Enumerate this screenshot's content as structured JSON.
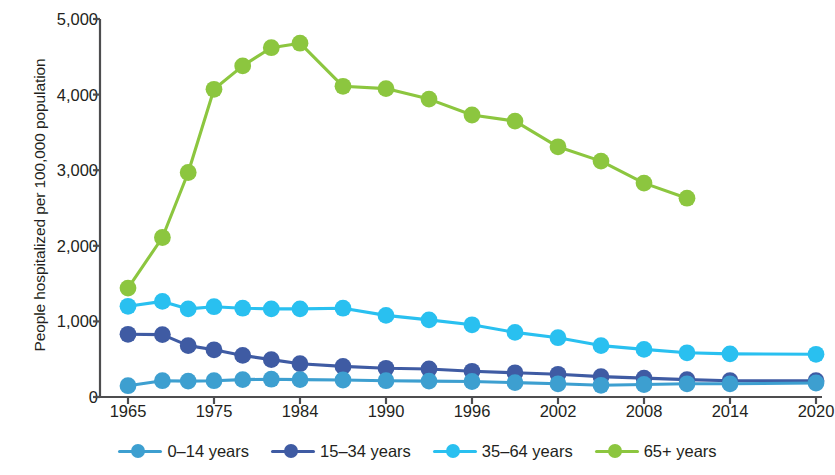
{
  "chart_data": {
    "type": "line",
    "title": "",
    "xlabel": "",
    "ylabel": "People hospitalized per 100,000 population",
    "ylim": [
      0,
      5000
    ],
    "ytick_values": [
      0,
      1000,
      2000,
      3000,
      4000,
      5000
    ],
    "ytick_labels": [
      "0",
      "1,000",
      "2,000",
      "3,000",
      "4,000",
      "5,000"
    ],
    "xtick_labels": [
      "1965",
      "1975",
      "1984",
      "1990",
      "1996",
      "2002",
      "2008",
      "2014",
      "2020"
    ],
    "xtick_values": [
      1965,
      1975,
      1984,
      1990,
      1996,
      2002,
      2008,
      2014,
      2020
    ],
    "x": [
      1965,
      1969,
      1972,
      1975,
      1978,
      1981,
      1984,
      1987,
      1990,
      1993,
      1996,
      1999,
      2002,
      2005,
      2008,
      2011,
      2014,
      2020
    ],
    "grid": false,
    "legend_position": "bottom",
    "series": [
      {
        "name": "0–14 years",
        "color": "#3d9fd0",
        "values": [
          150,
          215,
          210,
          215,
          230,
          235,
          230,
          225,
          215,
          210,
          205,
          190,
          175,
          155,
          165,
          175,
          175,
          185
        ]
      },
      {
        "name": "15–34 years",
        "color": "#3f5ba3",
        "values": [
          830,
          825,
          680,
          625,
          550,
          495,
          440,
          405,
          380,
          370,
          340,
          320,
          300,
          270,
          250,
          230,
          215,
          215
        ]
      },
      {
        "name": "35–64 years",
        "color": "#29c0f0",
        "values": [
          1200,
          1265,
          1165,
          1195,
          1175,
          1165,
          1165,
          1175,
          1080,
          1020,
          955,
          855,
          785,
          680,
          630,
          585,
          570,
          565
        ]
      },
      {
        "name": "65+ years",
        "color": "#8cc63f",
        "values": [
          1440,
          2110,
          2970,
          4070,
          4380,
          4620,
          4680,
          4110,
          4080,
          3940,
          3730,
          3650,
          3310,
          3120,
          2830,
          2630,
          null,
          null
        ]
      }
    ],
    "green_x": [
      1965,
      1969,
      1972,
      1975,
      1978,
      1981,
      1984,
      1987,
      1990,
      1993,
      1996,
      1999,
      2002,
      2005,
      2008,
      2011
    ],
    "legend": [
      {
        "label": "0–14 years",
        "color": "#3d9fd0"
      },
      {
        "label": "15–34 years",
        "color": "#3f5ba3"
      },
      {
        "label": "35–64 years",
        "color": "#29c0f0"
      },
      {
        "label": "65+ years",
        "color": "#8cc63f"
      }
    ]
  },
  "axis": {
    "y_title": "People hospitalized per 100,000 population"
  }
}
